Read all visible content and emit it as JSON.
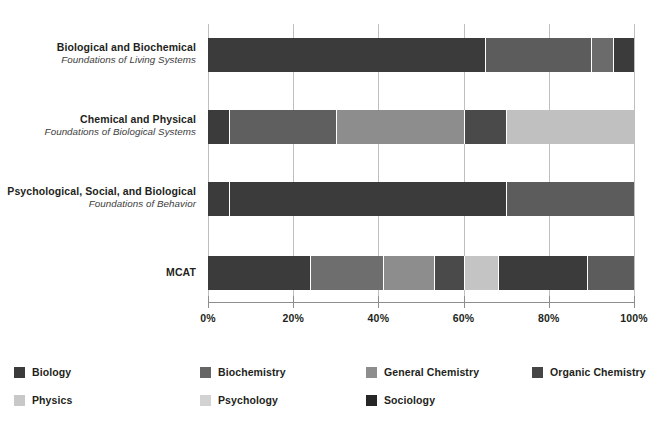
{
  "chart_data": {
    "type": "bar",
    "orientation": "horizontal",
    "stacked": true,
    "normalized_percent": true,
    "title": "",
    "subtitle": "",
    "xlabel": "",
    "ylabel": "",
    "xlim": [
      0,
      100
    ],
    "xticks": [
      0,
      20,
      40,
      60,
      80,
      100
    ],
    "xtick_labels": [
      "0%",
      "20%",
      "40%",
      "60%",
      "80%",
      "100%"
    ],
    "grid": "vertical",
    "legend_position": "bottom",
    "categories": [
      {
        "title": "Biological and Biochemical",
        "subtitle": "Foundations of Living Systems"
      },
      {
        "title": "Chemical and Physical",
        "subtitle": "Foundations of Biological Systems"
      },
      {
        "title": "Psychological, Social, and Biological",
        "subtitle": "Foundations of Behavior"
      },
      {
        "title": "MCAT",
        "subtitle": ""
      }
    ],
    "series": [
      {
        "name": "Biology",
        "color": "#3b3b3b",
        "values": [
          65,
          5,
          5,
          25
        ]
      },
      {
        "name": "Biochemistry",
        "color": "#5c5c5c",
        "values": [
          25,
          25,
          0,
          17
        ]
      },
      {
        "name": "General Chemistry",
        "color": "#8d8d8d",
        "values": [
          0,
          30,
          0,
          10
        ]
      },
      {
        "name": "Organic Chemistry",
        "color": "#4a4a4a",
        "values": [
          5,
          0,
          0,
          7
        ]
      },
      {
        "name": "Physics",
        "color": "#bcbcbc",
        "values": [
          0,
          25,
          0,
          6
        ]
      },
      {
        "name": "Psychology",
        "color": "#cacaca",
        "values": [
          0,
          0,
          65,
          24
        ]
      },
      {
        "name": "Sociology",
        "color": "#2a2a2a",
        "values": [
          5,
          15,
          30,
          11
        ]
      }
    ],
    "stack_order": [
      "Biology",
      "Biochemistry",
      "General Chemistry",
      "Organic Chemistry",
      "Physics",
      "Psychology",
      "Sociology"
    ],
    "bars": [
      {
        "category": "Biological and Biochemical",
        "segments": [
          {
            "series": "Biology",
            "start": 0,
            "end": 65,
            "value": 65,
            "color": "#3b3b3b"
          },
          {
            "series": "Biochemistry",
            "start": 65,
            "end": 90,
            "value": 25,
            "color": "#5c5c5c"
          },
          {
            "series": "Organic Chemistry",
            "start": 90,
            "end": 95,
            "value": 5,
            "color": "#6b6b6b"
          },
          {
            "series": "Sociology",
            "start": 95,
            "end": 100,
            "value": 5,
            "color": "#3b3b3b"
          }
        ]
      },
      {
        "category": "Chemical and Physical",
        "segments": [
          {
            "series": "Biology",
            "start": 0,
            "end": 5,
            "value": 5,
            "color": "#3b3b3b"
          },
          {
            "series": "Biochemistry",
            "start": 5,
            "end": 30,
            "value": 25,
            "color": "#5f5f5f"
          },
          {
            "series": "General Chemistry",
            "start": 30,
            "end": 60,
            "value": 30,
            "color": "#8d8d8d"
          },
          {
            "series": "Organic Chemistry",
            "start": 60,
            "end": 70,
            "value": 10,
            "color": "#4a4a4a"
          },
          {
            "series": "Physics",
            "start": 70,
            "end": 100,
            "value": 30,
            "color": "#c0c0c0"
          }
        ]
      },
      {
        "category": "Psychological, Social, and Biological",
        "segments": [
          {
            "series": "Biology",
            "start": 0,
            "end": 5,
            "value": 5,
            "color": "#3b3b3b"
          },
          {
            "series": "Psychology",
            "start": 5,
            "end": 70,
            "value": 65,
            "color": "#3b3b3b"
          },
          {
            "series": "Sociology",
            "start": 70,
            "end": 100,
            "value": 30,
            "color": "#5c5c5c"
          }
        ]
      },
      {
        "category": "MCAT",
        "segments": [
          {
            "series": "Biology",
            "start": 0,
            "end": 24,
            "value": 24,
            "color": "#3b3b3b"
          },
          {
            "series": "Biochemistry",
            "start": 24,
            "end": 41,
            "value": 17,
            "color": "#6e6e6e"
          },
          {
            "series": "General Chemistry",
            "start": 41,
            "end": 53,
            "value": 12,
            "color": "#8d8d8d"
          },
          {
            "series": "Organic Chemistry",
            "start": 53,
            "end": 60,
            "value": 7,
            "color": "#4a4a4a"
          },
          {
            "series": "Physics",
            "start": 60,
            "end": 68,
            "value": 8,
            "color": "#c4c4c4"
          },
          {
            "series": "Psychology",
            "start": 68,
            "end": 89,
            "value": 21,
            "color": "#3b3b3b"
          },
          {
            "series": "Sociology",
            "start": 89,
            "end": 100,
            "value": 11,
            "color": "#5c5c5c"
          }
        ]
      }
    ],
    "legend": [
      {
        "label": "Biology",
        "color": "#3b3b3b"
      },
      {
        "label": "Biochemistry",
        "color": "#666666"
      },
      {
        "label": "General Chemistry",
        "color": "#8d8d8d"
      },
      {
        "label": "Organic Chemistry",
        "color": "#454545"
      },
      {
        "label": "Physics",
        "color": "#c8c8c8"
      },
      {
        "label": "Psychology",
        "color": "#d2d2d2"
      },
      {
        "label": "Sociology",
        "color": "#262626"
      }
    ]
  }
}
